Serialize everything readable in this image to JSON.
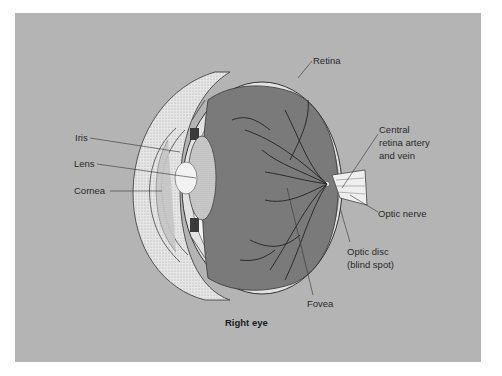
{
  "diagram": {
    "caption": "Right eye",
    "labels": {
      "retina": "Retina",
      "central_artery_line1": "Central",
      "central_artery_line2": "retina artery",
      "central_artery_line3": "and vein",
      "iris": "Iris",
      "lens": "Lens",
      "cornea": "Cornea",
      "optic_nerve": "Optic nerve",
      "optic_disc_line1": "Optic disc",
      "optic_disc_line2": "(blind spot)",
      "fovea": "Fovea"
    },
    "colors": {
      "background": "#b4b4b4",
      "interior": "#7a7a7a",
      "sclera": "#e8e8e8",
      "lens": "#f2f2f2",
      "ink": "#2a2a2a"
    }
  }
}
